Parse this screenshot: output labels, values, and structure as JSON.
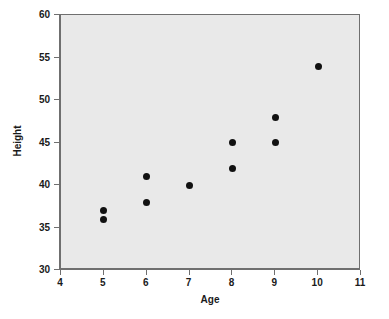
{
  "chart_data": {
    "type": "scatter",
    "title": "",
    "xlabel": "Age",
    "ylabel": "Height",
    "xlim": [
      4,
      11
    ],
    "ylim": [
      30,
      60
    ],
    "xticks": [
      4,
      5,
      6,
      7,
      8,
      9,
      10,
      11
    ],
    "yticks": [
      30,
      35,
      40,
      45,
      50,
      55,
      60
    ],
    "xticklabels": [
      "4",
      "5",
      "6",
      "7",
      "8",
      "9",
      "10",
      "11"
    ],
    "yticklabels": [
      "30",
      "35",
      "40",
      "45",
      "50",
      "55",
      "60"
    ],
    "grid": false,
    "legend": null,
    "marker": "circle",
    "marker_color": "#111111",
    "plot_background": "#e9e9e9",
    "figure_background": "#ffffff",
    "points": [
      {
        "x": 5,
        "y": 36
      },
      {
        "x": 5,
        "y": 37
      },
      {
        "x": 6,
        "y": 38
      },
      {
        "x": 6,
        "y": 41
      },
      {
        "x": 7,
        "y": 40
      },
      {
        "x": 8,
        "y": 42
      },
      {
        "x": 8,
        "y": 45
      },
      {
        "x": 9,
        "y": 45
      },
      {
        "x": 9,
        "y": 48
      },
      {
        "x": 10,
        "y": 54
      }
    ]
  }
}
